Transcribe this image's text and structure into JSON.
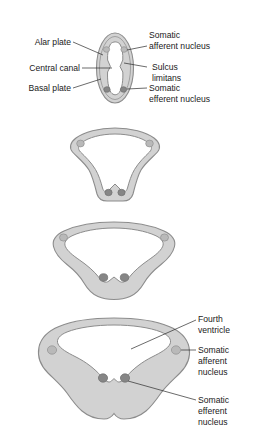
{
  "figure": {
    "background_color": "#ffffff",
    "tissue_color": "#d2d2d2",
    "tissue_outline_color": "#8c8c8c",
    "cavity_color": "#ffffff",
    "afferent_nucleus_color": "#b9b9b9",
    "efferent_nucleus_color": "#868686",
    "label_color": "#1a1a1a",
    "leader_color": "#2b2b2b"
  },
  "panels": [
    {
      "id": "panel-1",
      "stage_name": "neural-tube-closed",
      "cavity_name": "central canal",
      "labels_left": [
        {
          "text": "Alar plate",
          "name": "alar-plate"
        },
        {
          "text": "Central canal",
          "name": "central-canal"
        },
        {
          "text": "Basal plate",
          "name": "basal-plate"
        }
      ],
      "labels_right": [
        {
          "line1": "Somatic",
          "line2": "afferent nucleus",
          "name": "somatic-afferent-nucleus"
        },
        {
          "line1": "Sulcus",
          "line2": "limitans",
          "name": "sulcus-limitans"
        },
        {
          "line1": "Somatic",
          "line2": "efferent nucleus",
          "name": "somatic-efferent-nucleus"
        }
      ],
      "nuclei": [
        {
          "type": "afferent",
          "side": "left"
        },
        {
          "type": "afferent",
          "side": "right"
        },
        {
          "type": "efferent",
          "side": "left"
        },
        {
          "type": "efferent",
          "side": "right"
        }
      ]
    },
    {
      "id": "panel-2",
      "stage_name": "early-opening",
      "cavity_name": "widening canal",
      "nuclei": [
        {
          "type": "afferent",
          "side": "left"
        },
        {
          "type": "afferent",
          "side": "right"
        },
        {
          "type": "efferent",
          "side": "left"
        },
        {
          "type": "efferent",
          "side": "right"
        }
      ]
    },
    {
      "id": "panel-3",
      "stage_name": "mid-opening",
      "cavity_name": "widening canal",
      "nuclei": [
        {
          "type": "afferent",
          "side": "left"
        },
        {
          "type": "afferent",
          "side": "right"
        },
        {
          "type": "efferent",
          "side": "left"
        },
        {
          "type": "efferent",
          "side": "right"
        }
      ]
    },
    {
      "id": "panel-4",
      "stage_name": "fourth-ventricle-formed",
      "cavity_name": "fourth ventricle",
      "labels_right": [
        {
          "line1": "Fourth",
          "line2": "ventricle",
          "name": "fourth-ventricle"
        },
        {
          "line1": "Somatic",
          "line2": "afferent",
          "line3": "nucleus",
          "name": "somatic-afferent-nucleus"
        },
        {
          "line1": "Somatic",
          "line2": "efferent",
          "line3": "nucleus",
          "name": "somatic-efferent-nucleus"
        }
      ],
      "nuclei": [
        {
          "type": "afferent",
          "side": "left"
        },
        {
          "type": "afferent",
          "side": "right"
        },
        {
          "type": "efferent",
          "side": "left"
        },
        {
          "type": "efferent",
          "side": "right"
        }
      ]
    }
  ],
  "text": {
    "alar_plate": "Alar plate",
    "central_canal": "Central canal",
    "basal_plate": "Basal plate",
    "somatic_a": "Somatic",
    "afferent_nucleus": "afferent nucleus",
    "sulcus": "Sulcus",
    "limitans": "limitans",
    "somatic_e": "Somatic",
    "efferent_nucleus": "efferent nucleus",
    "fourth": "Fourth",
    "ventricle": "ventricle",
    "p4_somatic_a": "Somatic",
    "p4_afferent": "afferent",
    "p4_nucleus_a": "nucleus",
    "p4_somatic_e": "Somatic",
    "p4_efferent": "efferent",
    "p4_nucleus_e": "nucleus"
  }
}
